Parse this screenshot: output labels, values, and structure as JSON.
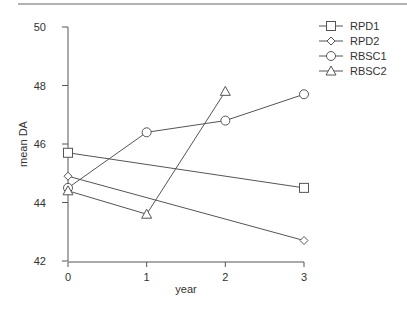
{
  "chart_data": {
    "type": "line",
    "title": "",
    "xlabel": "year",
    "ylabel": "mean DA",
    "x": [
      0,
      1,
      2,
      3
    ],
    "xticks": [
      "0",
      "1",
      "2",
      "3"
    ],
    "yticks": [
      "42",
      "44",
      "46",
      "48",
      "50"
    ],
    "ylim": [
      42,
      50
    ],
    "xlim": [
      0,
      3
    ],
    "grid": false,
    "legend_position": "top-right",
    "series": [
      {
        "name": "RPD1",
        "marker": "square",
        "points": [
          [
            0,
            45.7
          ],
          [
            3,
            44.5
          ]
        ]
      },
      {
        "name": "RPD2",
        "marker": "diamond",
        "points": [
          [
            0,
            44.9
          ],
          [
            3,
            42.7
          ]
        ]
      },
      {
        "name": "RBSC1",
        "marker": "circle",
        "points": [
          [
            0,
            44.5
          ],
          [
            1,
            46.4
          ],
          [
            2,
            46.8
          ],
          [
            3,
            47.7
          ]
        ]
      },
      {
        "name": "RBSC2",
        "marker": "triangle",
        "points": [
          [
            0,
            44.4
          ],
          [
            1,
            43.6
          ],
          [
            2,
            47.8
          ]
        ]
      }
    ]
  },
  "legend": [
    "RPD1",
    "RPD2",
    "RBSC1",
    "RBSC2"
  ],
  "axis": {
    "xlabel": "year",
    "ylabel": "mean DA"
  }
}
